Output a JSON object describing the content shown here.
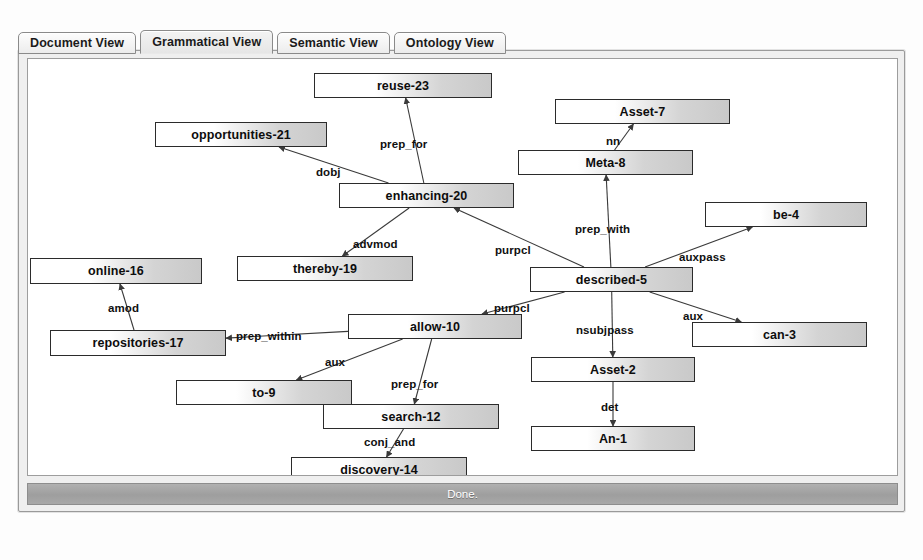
{
  "window": {
    "title": "Grammatical View",
    "status_text": "Done.",
    "caption": ""
  },
  "tabs": [
    {
      "label": "Document View",
      "active": false
    },
    {
      "label": "Grammatical View",
      "active": true
    },
    {
      "label": "Semantic View",
      "active": false
    },
    {
      "label": "Ontology View",
      "active": false
    }
  ],
  "graph": {
    "type": "dependency-parse-tree",
    "nodes": [
      {
        "id": "reuse-23",
        "label": "reuse-23",
        "x": 286,
        "y": 14,
        "w": 178,
        "h": 25
      },
      {
        "id": "Asset-7",
        "label": "Asset-7",
        "x": 527,
        "y": 40,
        "w": 175,
        "h": 25
      },
      {
        "id": "opportunities-21",
        "label": "opportunities-21",
        "x": 127,
        "y": 63,
        "w": 172,
        "h": 25
      },
      {
        "id": "Meta-8",
        "label": "Meta-8",
        "x": 490,
        "y": 91,
        "w": 175,
        "h": 25
      },
      {
        "id": "enhancing-20",
        "label": "enhancing-20",
        "x": 311,
        "y": 124,
        "w": 175,
        "h": 25
      },
      {
        "id": "be-4",
        "label": "be-4",
        "x": 677,
        "y": 143,
        "w": 162,
        "h": 25
      },
      {
        "id": "thereby-19",
        "label": "thereby-19",
        "x": 209,
        "y": 197,
        "w": 176,
        "h": 25
      },
      {
        "id": "online-16",
        "label": "online-16",
        "x": 2,
        "y": 199,
        "w": 172,
        "h": 26
      },
      {
        "id": "described-5",
        "label": "described-5",
        "x": 502,
        "y": 208,
        "w": 163,
        "h": 25
      },
      {
        "id": "allow-10",
        "label": "allow-10",
        "x": 320,
        "y": 255,
        "w": 174,
        "h": 25
      },
      {
        "id": "repositories-17",
        "label": "repositories-17",
        "x": 22,
        "y": 271,
        "w": 176,
        "h": 26
      },
      {
        "id": "can-3",
        "label": "can-3",
        "x": 664,
        "y": 263,
        "w": 175,
        "h": 25
      },
      {
        "id": "Asset-2",
        "label": "Asset-2",
        "x": 503,
        "y": 298,
        "w": 164,
        "h": 25
      },
      {
        "id": "to-9",
        "label": "to-9",
        "x": 148,
        "y": 321,
        "w": 176,
        "h": 25
      },
      {
        "id": "search-12",
        "label": "search-12",
        "x": 295,
        "y": 345,
        "w": 176,
        "h": 25
      },
      {
        "id": "An-1",
        "label": "An-1",
        "x": 503,
        "y": 367,
        "w": 164,
        "h": 25
      },
      {
        "id": "discovery-14",
        "label": "discovery-14",
        "x": 263,
        "y": 398,
        "w": 176,
        "h": 25
      }
    ],
    "edges": [
      {
        "from": "enhancing-20",
        "to": "reuse-23",
        "label": "prep_for",
        "lx": 352,
        "ly": 79
      },
      {
        "from": "enhancing-20",
        "to": "opportunities-21",
        "label": "dobj",
        "lx": 288,
        "ly": 107
      },
      {
        "from": "Meta-8",
        "to": "Asset-7",
        "label": "nn",
        "lx": 578,
        "ly": 76
      },
      {
        "from": "described-5",
        "to": "Meta-8",
        "label": "prep_with",
        "lx": 547,
        "ly": 164
      },
      {
        "from": "described-5",
        "to": "be-4",
        "label": "auxpass",
        "lx": 651,
        "ly": 192
      },
      {
        "from": "described-5",
        "to": "enhancing-20",
        "label": "purpcl",
        "lx": 467,
        "ly": 185
      },
      {
        "from": "enhancing-20",
        "to": "thereby-19",
        "label": "advmod",
        "lx": 325,
        "ly": 179
      },
      {
        "from": "described-5",
        "to": "allow-10",
        "label": "purpcl",
        "lx": 466,
        "ly": 243
      },
      {
        "from": "described-5",
        "to": "Asset-2",
        "label": "nsubjpass",
        "lx": 548,
        "ly": 265
      },
      {
        "from": "described-5",
        "to": "can-3",
        "label": "aux",
        "lx": 655,
        "ly": 251
      },
      {
        "from": "Asset-2",
        "to": "An-1",
        "label": "det",
        "lx": 573,
        "ly": 342
      },
      {
        "from": "repositories-17",
        "to": "online-16",
        "label": "amod",
        "lx": 80,
        "ly": 243
      },
      {
        "from": "allow-10",
        "to": "repositories-17",
        "label": "prep_within",
        "lx": 208,
        "ly": 271
      },
      {
        "from": "allow-10",
        "to": "to-9",
        "label": "aux",
        "lx": 297,
        "ly": 297
      },
      {
        "from": "allow-10",
        "to": "search-12",
        "label": "prep_for",
        "lx": 363,
        "ly": 319
      },
      {
        "from": "search-12",
        "to": "discovery-14",
        "label": "conj_and",
        "lx": 336,
        "ly": 377
      }
    ]
  },
  "colors": {
    "node_border": "#2b2b2b",
    "node_fill_light": "#ffffff",
    "node_fill_dark": "#c9c9c9",
    "edge_stroke": "#3a3a3a",
    "panel_bg": "#efefef",
    "canvas_bg": "#ffffff",
    "statusbar_bg": "#a5a5a5",
    "text": "#0d0d0d"
  }
}
